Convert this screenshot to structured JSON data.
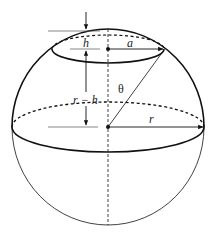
{
  "figure": {
    "labels": {
      "cap_height": "h",
      "cap_radius": "a",
      "angle": "θ",
      "distance_center_to_cap": "r − h",
      "sphere_radius": "r"
    },
    "colors": {
      "stroke": "#111111",
      "background": "#ffffff"
    }
  }
}
